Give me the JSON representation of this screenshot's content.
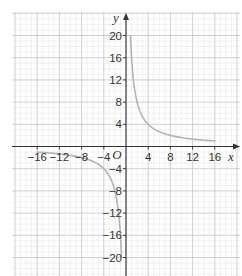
{
  "chart_data": {
    "type": "line",
    "title": "",
    "xlabel": "x",
    "ylabel": "y",
    "origin_label": "O",
    "xlim": [
      -20,
      20
    ],
    "ylim": [
      -24,
      24
    ],
    "grid": true,
    "grid_minor_step": 1,
    "grid_major_step": 4,
    "x_ticks": [
      -16,
      -12,
      -8,
      -4,
      4,
      8,
      12,
      16
    ],
    "y_ticks": [
      20,
      16,
      12,
      8,
      4,
      -4,
      -8,
      -12,
      -16,
      -20
    ],
    "x_tick_labels": [
      "−16",
      "−12",
      "−8",
      "−4",
      "4",
      "8",
      "12",
      "16"
    ],
    "y_tick_labels": [
      "20",
      "16",
      "12",
      "8",
      "4",
      "−4",
      "−8",
      "−12",
      "−16",
      "−20"
    ],
    "series": [
      {
        "name": "y = 16/x (x > 0)",
        "x": [
          0.8,
          1,
          1.5,
          2,
          3,
          4,
          6,
          8,
          10,
          12,
          16
        ],
        "y": [
          20,
          16,
          10.67,
          8,
          5.33,
          4,
          2.67,
          2,
          1.6,
          1.33,
          1
        ]
      },
      {
        "name": "y = 16/x (x < 0)",
        "x": [
          -16,
          -12,
          -10,
          -8,
          -6,
          -4,
          -3,
          -2,
          -1.5,
          -1,
          -0.8
        ],
        "y": [
          -1,
          -1.33,
          -1.6,
          -2,
          -2.67,
          -4,
          -5.33,
          -8,
          -10.67,
          -16,
          -20
        ]
      }
    ],
    "line_color": "#b3b3b3",
    "axis_color": "#333333",
    "grid_color": "#d0d0d0"
  }
}
